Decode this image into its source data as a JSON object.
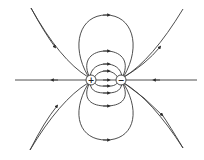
{
  "diagram": {
    "charges": [
      {
        "id": "positive",
        "symbol": "+",
        "x": 91,
        "y": 80
      },
      {
        "id": "negative",
        "symbol": "−",
        "x": 121,
        "y": 80
      }
    ],
    "colors": {
      "line": "#3a3a3a",
      "background": "#ffffff"
    },
    "field_line_direction": "from positive to negative"
  }
}
